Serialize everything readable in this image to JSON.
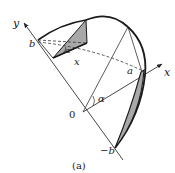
{
  "figure": {
    "caption": "(a)",
    "labels": {
      "y_axis": "y",
      "x_axis": "x",
      "x_inner": "x",
      "b": "b",
      "neg_b": "−b",
      "origin": "0",
      "a": "a",
      "alpha_origin": "α",
      "alpha_top": "α"
    },
    "colors": {
      "stroke": "#1a1a1a",
      "shade": "#a8a8a8",
      "thin": "#333333"
    }
  }
}
